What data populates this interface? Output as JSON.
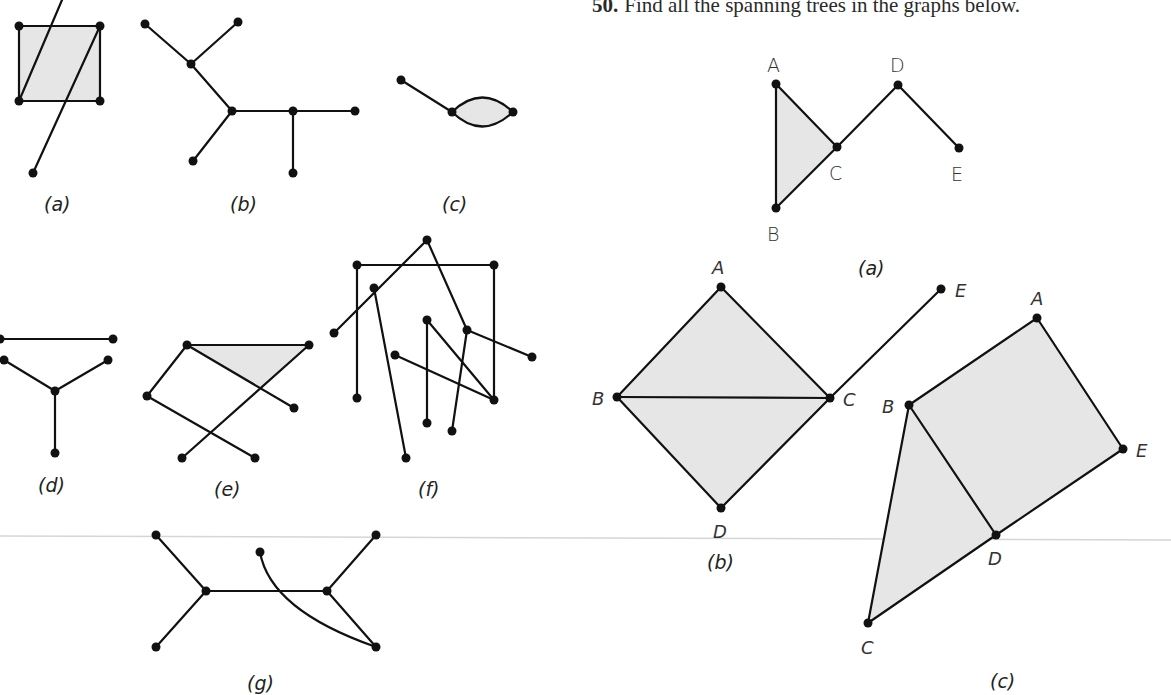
{
  "exercise": {
    "number": "50.",
    "prompt": "Find all the spanning trees in the graphs below."
  },
  "colors": {
    "edge": "#111111",
    "node": "#111111",
    "face_fill": "#e6e6e6",
    "rule_line": "#d6d6d6"
  },
  "left_figures": [
    {
      "caption": "(a)",
      "description": "square with two diagonal-like crossing edges, shaded interior"
    },
    {
      "caption": "(b)",
      "description": "tree with 9 vertices"
    },
    {
      "caption": "(c)",
      "description": "pendant edge attached to a double edge (shaded lens)"
    },
    {
      "caption": "(d)",
      "description": "isolated edge plus a 3-leaf star"
    },
    {
      "caption": "(e)",
      "description": "graph with shaded triangle and crossing edges"
    },
    {
      "caption": "(f)",
      "description": "tangled graph with many crossings"
    },
    {
      "caption": "(g)",
      "description": "two 3-stars joined, with a curved edge"
    }
  ],
  "right_figures": {
    "a": {
      "caption": "(a)",
      "vertices": [
        "A",
        "B",
        "C",
        "D",
        "E"
      ],
      "edges": [
        [
          "A",
          "B"
        ],
        [
          "A",
          "C"
        ],
        [
          "B",
          "C"
        ],
        [
          "C",
          "D"
        ],
        [
          "D",
          "E"
        ]
      ]
    },
    "b": {
      "caption": "(b)",
      "vertices": [
        "A",
        "B",
        "C",
        "D",
        "E"
      ],
      "edges": [
        [
          "A",
          "B"
        ],
        [
          "A",
          "C"
        ],
        [
          "B",
          "C"
        ],
        [
          "B",
          "D"
        ],
        [
          "C",
          "D"
        ],
        [
          "C",
          "E"
        ]
      ]
    },
    "c": {
      "caption": "(c)",
      "vertices": [
        "A",
        "B",
        "C",
        "D",
        "E"
      ],
      "edges": [
        [
          "A",
          "B"
        ],
        [
          "A",
          "E"
        ],
        [
          "B",
          "D"
        ],
        [
          "D",
          "E"
        ],
        [
          "B",
          "C"
        ],
        [
          "C",
          "D"
        ]
      ]
    }
  }
}
